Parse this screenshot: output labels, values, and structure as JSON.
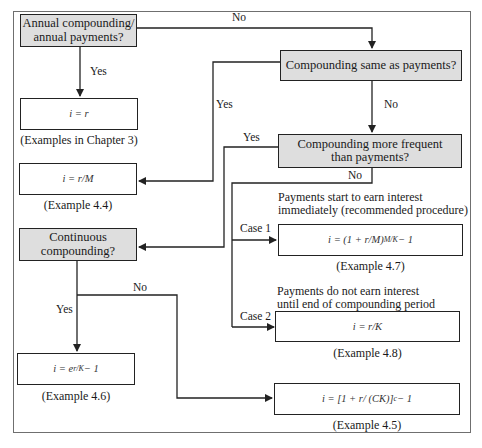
{
  "decisions": {
    "annual": "Annual compounding/ annual payments?",
    "annual_line1": "Annual compounding/",
    "annual_line2": "annual payments?",
    "same": "Compounding same as payments?",
    "more_freq_line1": "Compounding more frequent",
    "more_freq_line2": "than payments?",
    "continuous_line1": "Continuous",
    "continuous_line2": "compounding?"
  },
  "formulas": {
    "i_eq_r": {
      "base": "i = r"
    },
    "i_eq_r_over_M": {
      "base": "i = r/M"
    },
    "case1": {
      "base": "i = (1 + r/M)",
      "sup": "M/K",
      "tail": " − 1"
    },
    "case2": {
      "base": "i = r/K"
    },
    "continuous_yes": {
      "base": "i = e",
      "sup": "r/K",
      "tail": " − 1"
    },
    "continuous_no": {
      "base": "i = [1 + r/ (CK)]",
      "sup": "c",
      "tail": " − 1"
    }
  },
  "captions": {
    "i_eq_r": "(Examples in Chapter 3)",
    "i_eq_r_over_M": "(Example 4.4)",
    "case1": "(Example 4.7)",
    "case2": "(Example 4.8)",
    "continuous_yes": "(Example 4.6)",
    "continuous_no": "(Example 4.5)"
  },
  "notes": {
    "case1_line1": "Payments start to earn interest",
    "case1_line2": "immediately (recommended procedure)",
    "case2_line1": "Payments do not earn interest",
    "case2_line2": "until end of compounding period"
  },
  "edge_labels": {
    "annual_no": "No",
    "annual_yes": "Yes",
    "same_yes": "Yes",
    "same_no": "No",
    "more_freq_yes": "Yes",
    "more_freq_no": "No",
    "case1": "Case 1",
    "case2": "Case 2",
    "continuous_yes": "Yes",
    "continuous_no": "No"
  },
  "colors": {
    "decision_fill": "#dedede",
    "line": "#222222",
    "frame": "#6f6f6f"
  }
}
